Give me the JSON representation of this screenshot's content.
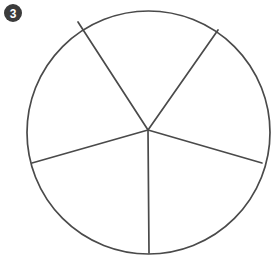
{
  "canvas": {
    "width": 277,
    "height": 261,
    "background_color": "#ffffff"
  },
  "badge": {
    "label": "3",
    "shape": "filled-circle",
    "fill_color": "#3b3b3b",
    "text_color": "#ffffff",
    "center_x": 13,
    "center_y": 13,
    "radius": 9
  },
  "chart_data": {
    "type": "pie",
    "title": "",
    "subtitle": "",
    "xlabel": "",
    "ylabel": "",
    "grid": false,
    "legend": false,
    "legend_position": "none",
    "annotations": [
      "3"
    ],
    "stroke_color": "#4a4a4a",
    "fill_color": "#ffffff",
    "stroke_width": 1.7,
    "circle": {
      "center_x": 148.5,
      "center_y": 132.5,
      "radius": 121.5
    },
    "vertex": {
      "x": 148,
      "y": 130
    },
    "slice_count": 5,
    "categories": [
      "Slice 1",
      "Slice 2",
      "Slice 3",
      "Slice 4",
      "Slice 5"
    ],
    "values": [
      45,
      76,
      77,
      83,
      79
    ],
    "spoke_angles_deg": [
      -108,
      -63,
      13,
      90,
      166
    ],
    "spoke_endpoints": [
      {
        "x": 78,
        "y": 22
      },
      {
        "x": 218,
        "y": 30
      },
      {
        "x": 262,
        "y": 163
      },
      {
        "x": 149,
        "y": 253
      },
      {
        "x": 32,
        "y": 163
      }
    ]
  }
}
